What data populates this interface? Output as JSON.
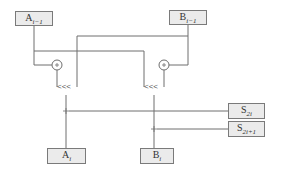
{
  "diagram": {
    "type": "block-diagram",
    "inputs": [
      {
        "id": "a_prev",
        "base": "A",
        "subscript": "i−1"
      },
      {
        "id": "b_prev",
        "base": "B",
        "subscript": "i−1"
      }
    ],
    "outputs": [
      {
        "id": "a_next",
        "base": "A",
        "subscript": "i"
      },
      {
        "id": "b_next",
        "base": "B",
        "subscript": "i"
      }
    ],
    "keys": [
      {
        "id": "s_2i",
        "base": "S",
        "subscript": "2i"
      },
      {
        "id": "s_2i1",
        "base": "S",
        "subscript": "2i+1"
      }
    ],
    "operators": [
      {
        "id": "add_left",
        "symbol": "+"
      },
      {
        "id": "add_right",
        "symbol": "+"
      }
    ],
    "rotations": [
      {
        "id": "rot_left",
        "label": "<<<"
      },
      {
        "id": "rot_right",
        "label": "<<<"
      }
    ],
    "junctions": [
      {
        "id": "j_left",
        "symbol": "+"
      },
      {
        "id": "j_right",
        "symbol": "+"
      }
    ],
    "colors": {
      "line": "#6e6e6e",
      "box_fill": "#ebebeb",
      "box_border": "#7a7a7a"
    }
  }
}
